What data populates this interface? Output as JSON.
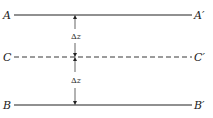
{
  "diagram": {
    "lines": [
      {
        "id": "A",
        "left_label": "A",
        "right_label": "A′",
        "style": "solid",
        "y": 15
      },
      {
        "id": "C",
        "left_label": "C",
        "right_label": "C′",
        "style": "dashed",
        "y": 57
      },
      {
        "id": "B",
        "left_label": "B",
        "right_label": "B′",
        "style": "solid",
        "y": 105
      }
    ],
    "dimensions": [
      {
        "from": "A",
        "to": "C",
        "label_symbol": "Δ",
        "label_var": "z"
      },
      {
        "from": "C",
        "to": "B",
        "label_symbol": "Δ",
        "label_var": "z"
      }
    ],
    "colors": {
      "ink": "#222222",
      "background": "#ffffff"
    }
  }
}
